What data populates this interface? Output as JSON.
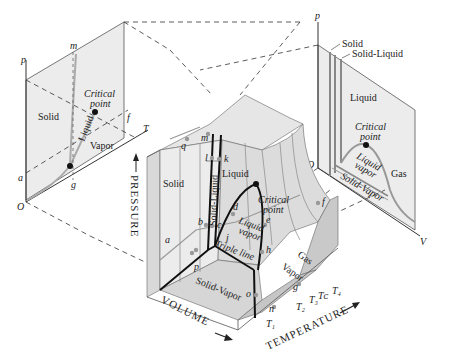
{
  "left_projection": {
    "axis_p": "p",
    "axis_T": "T",
    "origin": "O",
    "point_a": "a",
    "point_g": "g",
    "point_m": "m",
    "point_f": "f",
    "region_solid": "Solid",
    "region_vapor": "Vapor",
    "line_liquid": "Liquid",
    "critical_point_l1": "Critical",
    "critical_point_l2": "point"
  },
  "right_projection": {
    "axis_p": "p",
    "axis_V": "V",
    "origin": "O",
    "callout_solid": "Solid",
    "callout_solid_liquid": "Solid-Liquid",
    "region_liquid": "Liquid",
    "region_gas": "Gas",
    "region_liquid_vapor_l1": "Liquid",
    "region_liquid_vapor_l2": "vapor",
    "region_solid_vapor": "Solid-Vapor",
    "critical_point_l1": "Critical",
    "critical_point_l2": "point"
  },
  "surface": {
    "axis_pressure": "PRESSURE",
    "axis_volume": "VOLUME",
    "axis_temperature": "TEMPERATURE",
    "region_solid": "Solid",
    "region_liquid": "Liquid",
    "region_solid_liquid": "Solid-Liquid",
    "region_liquid_vapor_l1": "Liquid",
    "region_liquid_vapor_l2": "vapor",
    "region_gas": "Gas",
    "region_vapor": "Vapor",
    "region_solid_vapor": "Solid-Vapor",
    "triple_line": "Triple line",
    "critical_point_l1": "Critical",
    "critical_point_l2": "point",
    "points": [
      "a",
      "b",
      "c",
      "d",
      "e",
      "f",
      "g",
      "h",
      "j",
      "k",
      "l",
      "m",
      "n",
      "o",
      "p",
      "q"
    ],
    "isotherms": [
      "T₁",
      "T₂",
      "T₃",
      "Tᴄ",
      "T₄"
    ]
  },
  "colors": {
    "surface_light": "#e6e6e6",
    "surface_mid": "#d2d2d2",
    "surface_dark": "#bdbdbd",
    "line": "#111111",
    "grey_line": "#9a9a9a",
    "point": "#9a9a9a"
  }
}
